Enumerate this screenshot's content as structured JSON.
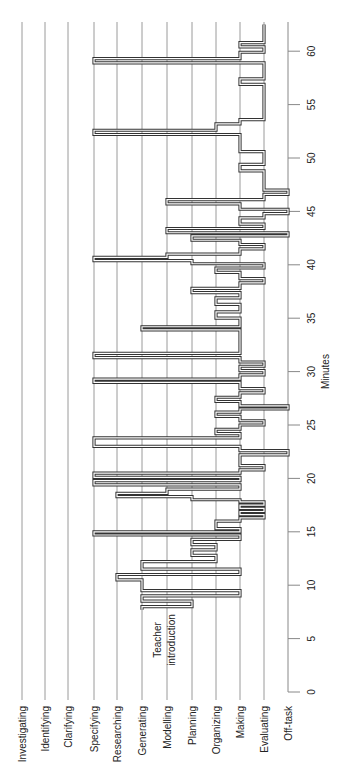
{
  "chart_data": {
    "type": "line",
    "subtype": "step-timeline",
    "orientation": "rotated-90-ccw",
    "title": "",
    "xlabel": "Minutes",
    "ylabel": "",
    "xlim": [
      0,
      62
    ],
    "x_ticks": [
      0,
      5,
      10,
      15,
      20,
      25,
      30,
      35,
      40,
      45,
      50,
      55,
      60
    ],
    "grid": true,
    "legend": null,
    "categories": [
      "Investigating",
      "Identifying",
      "Clarifying",
      "Specifying",
      "Researching",
      "Generating",
      "Modelling",
      "Planning",
      "Organizing",
      "Making",
      "Evaluating",
      "Off-task"
    ],
    "annotations": [
      {
        "text": "Teacher introduction",
        "x": 7.5,
        "category": "Modelling"
      }
    ],
    "series": [
      {
        "name": "Activity",
        "points": [
          [
            7.7,
            "Generating"
          ],
          [
            8.0,
            "Planning"
          ],
          [
            8.5,
            "Generating"
          ],
          [
            9.0,
            "Making"
          ],
          [
            9.5,
            "Generating"
          ],
          [
            10.5,
            "Researching"
          ],
          [
            11.0,
            "Making"
          ],
          [
            11.5,
            "Generating"
          ],
          [
            12.2,
            "Organizing"
          ],
          [
            12.8,
            "Planning"
          ],
          [
            13.3,
            "Organizing"
          ],
          [
            13.8,
            "Planning"
          ],
          [
            14.3,
            "Making"
          ],
          [
            14.7,
            "Specifying"
          ],
          [
            15.0,
            "Making"
          ],
          [
            15.3,
            "Organizing"
          ],
          [
            16.0,
            "Making"
          ],
          [
            16.3,
            "Evaluating"
          ],
          [
            16.6,
            "Making"
          ],
          [
            16.9,
            "Evaluating"
          ],
          [
            17.2,
            "Making"
          ],
          [
            17.5,
            "Evaluating"
          ],
          [
            17.8,
            "Making"
          ],
          [
            18.0,
            "Planning"
          ],
          [
            18.3,
            "Researching"
          ],
          [
            18.6,
            "Modelling"
          ],
          [
            19.0,
            "Making"
          ],
          [
            19.4,
            "Specifying"
          ],
          [
            19.8,
            "Making"
          ],
          [
            20.1,
            "Specifying"
          ],
          [
            20.5,
            "Making"
          ],
          [
            20.8,
            "Evaluating"
          ],
          [
            21.2,
            "Making"
          ],
          [
            22.2,
            "Off-task"
          ],
          [
            22.6,
            "Making"
          ],
          [
            23.0,
            "Specifying"
          ],
          [
            23.8,
            "Making"
          ],
          [
            24.2,
            "Organizing"
          ],
          [
            24.6,
            "Making"
          ],
          [
            25.0,
            "Evaluating"
          ],
          [
            25.4,
            "Making"
          ],
          [
            25.8,
            "Organizing"
          ],
          [
            26.2,
            "Making"
          ],
          [
            26.5,
            "Off-task"
          ],
          [
            26.8,
            "Making"
          ],
          [
            27.2,
            "Organizing"
          ],
          [
            27.6,
            "Making"
          ],
          [
            28.0,
            "Evaluating"
          ],
          [
            28.4,
            "Making"
          ],
          [
            29.0,
            "Specifying"
          ],
          [
            29.3,
            "Making"
          ],
          [
            29.7,
            "Evaluating"
          ],
          [
            30.1,
            "Making"
          ],
          [
            30.5,
            "Evaluating"
          ],
          [
            30.9,
            "Making"
          ],
          [
            31.3,
            "Specifying"
          ],
          [
            31.7,
            "Making"
          ],
          [
            33.9,
            "Generating"
          ],
          [
            34.2,
            "Making"
          ],
          [
            35.0,
            "Organizing"
          ],
          [
            35.6,
            "Making"
          ],
          [
            36.3,
            "Organizing"
          ],
          [
            36.9,
            "Making"
          ],
          [
            37.4,
            "Planning"
          ],
          [
            37.8,
            "Making"
          ],
          [
            38.3,
            "Evaluating"
          ],
          [
            38.7,
            "Making"
          ],
          [
            39.3,
            "Organizing"
          ],
          [
            39.7,
            "Evaluating"
          ],
          [
            40.1,
            "Planning"
          ],
          [
            40.4,
            "Specifying"
          ],
          [
            40.7,
            "Modelling"
          ],
          [
            41.0,
            "Making"
          ],
          [
            41.5,
            "Evaluating"
          ],
          [
            41.9,
            "Making"
          ],
          [
            42.3,
            "Planning"
          ],
          [
            42.7,
            "Off-task"
          ],
          [
            43.0,
            "Modelling"
          ],
          [
            43.4,
            "Evaluating"
          ],
          [
            43.8,
            "Making"
          ],
          [
            44.4,
            "Evaluating"
          ],
          [
            44.8,
            "Off-task"
          ],
          [
            45.2,
            "Making"
          ],
          [
            45.7,
            "Modelling"
          ],
          [
            46.1,
            "Evaluating"
          ],
          [
            46.6,
            "Off-task"
          ],
          [
            47.0,
            "Evaluating"
          ],
          [
            48.8,
            "Making"
          ],
          [
            49.4,
            "Evaluating"
          ],
          [
            50.6,
            "Making"
          ],
          [
            52.2,
            "Specifying"
          ],
          [
            52.6,
            "Organizing"
          ],
          [
            53.2,
            "Making"
          ],
          [
            53.6,
            "Evaluating"
          ],
          [
            56.9,
            "Making"
          ],
          [
            57.4,
            "Evaluating"
          ],
          [
            58.9,
            "Specifying"
          ],
          [
            59.3,
            "Making"
          ],
          [
            59.9,
            "Evaluating"
          ],
          [
            60.4,
            "Making"
          ],
          [
            60.8,
            "Evaluating"
          ],
          [
            62.5,
            "Evaluating"
          ]
        ]
      }
    ],
    "colors": {
      "trace": "#333333",
      "gridline": "#9a9a9a",
      "axis": "#888888",
      "text": "#222222"
    }
  }
}
